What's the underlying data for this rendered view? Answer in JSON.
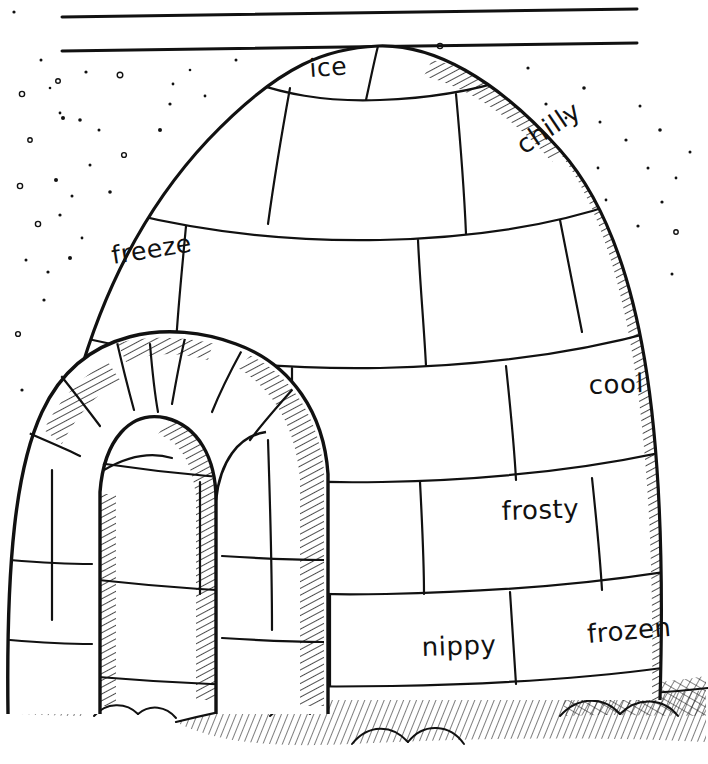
{
  "page": {
    "background_color": "#ffffff",
    "ink_color": "#111111",
    "width": 708,
    "height": 764
  },
  "header_rules": {
    "name": "ruled-lines",
    "count": 2,
    "lines": [
      {
        "x1": 62,
        "y1": 17,
        "x2": 637,
        "y2": 9
      },
      {
        "x1": 62,
        "y1": 51,
        "x2": 637,
        "y2": 43
      }
    ]
  },
  "scene": {
    "subject": "igloo",
    "description": "Hand-drawn line art of an igloo built from snow blocks, with falling snow in the sky and a shadowed snowy ground.",
    "parts": [
      "dome",
      "entrance-tunnel",
      "snowfall",
      "ground-shadow",
      "snow-mounds"
    ]
  },
  "words": [
    {
      "id": "ice",
      "text": "ice",
      "x": 310,
      "y": 77,
      "rotation": -4,
      "size": 25
    },
    {
      "id": "chilly",
      "text": "chilly",
      "x": 524,
      "y": 155,
      "rotation": -34,
      "size": 26
    },
    {
      "id": "freeze",
      "text": "freeze",
      "x": 113,
      "y": 264,
      "rotation": -9,
      "size": 25
    },
    {
      "id": "cool",
      "text": "cool",
      "x": 589,
      "y": 394,
      "rotation": -2,
      "size": 26
    },
    {
      "id": "frosty",
      "text": "frosty",
      "x": 502,
      "y": 520,
      "rotation": -2,
      "size": 26
    },
    {
      "id": "nippy",
      "text": "nippy",
      "x": 422,
      "y": 656,
      "rotation": -2,
      "size": 26
    },
    {
      "id": "frozen",
      "text": "frozen",
      "x": 588,
      "y": 643,
      "rotation": -5,
      "size": 26
    }
  ],
  "snowflakes": [
    {
      "x": 22,
      "y": 94,
      "r": 2.6,
      "ring": true
    },
    {
      "x": 41,
      "y": 60,
      "r": 1.5,
      "ring": false
    },
    {
      "x": 58,
      "y": 81,
      "r": 2.3,
      "ring": true
    },
    {
      "x": 60,
      "y": 113,
      "r": 1.4,
      "ring": false
    },
    {
      "x": 86,
      "y": 72,
      "r": 1.6,
      "ring": false
    },
    {
      "x": 30,
      "y": 140,
      "r": 2.2,
      "ring": true
    },
    {
      "x": 50,
      "y": 88,
      "r": 1.3,
      "ring": false
    },
    {
      "x": 120,
      "y": 75,
      "r": 2.8,
      "ring": true
    },
    {
      "x": 63,
      "y": 118,
      "r": 2.0,
      "ring": false
    },
    {
      "x": 80,
      "y": 120,
      "r": 1.8,
      "ring": false
    },
    {
      "x": 99,
      "y": 130,
      "r": 1.5,
      "ring": false
    },
    {
      "x": 124,
      "y": 155,
      "r": 2.4,
      "ring": true
    },
    {
      "x": 160,
      "y": 130,
      "r": 2.0,
      "ring": false
    },
    {
      "x": 173,
      "y": 84,
      "r": 1.4,
      "ring": false
    },
    {
      "x": 170,
      "y": 104,
      "r": 1.6,
      "ring": false
    },
    {
      "x": 20,
      "y": 186,
      "r": 2.6,
      "ring": true
    },
    {
      "x": 56,
      "y": 180,
      "r": 2.0,
      "ring": false
    },
    {
      "x": 72,
      "y": 196,
      "r": 1.5,
      "ring": false
    },
    {
      "x": 90,
      "y": 165,
      "r": 1.5,
      "ring": false
    },
    {
      "x": 110,
      "y": 192,
      "r": 1.8,
      "ring": false
    },
    {
      "x": 38,
      "y": 224,
      "r": 2.6,
      "ring": true
    },
    {
      "x": 60,
      "y": 215,
      "r": 1.6,
      "ring": false
    },
    {
      "x": 82,
      "y": 238,
      "r": 1.4,
      "ring": false
    },
    {
      "x": 26,
      "y": 260,
      "r": 1.5,
      "ring": false
    },
    {
      "x": 48,
      "y": 272,
      "r": 1.6,
      "ring": false
    },
    {
      "x": 70,
      "y": 258,
      "r": 2.0,
      "ring": false
    },
    {
      "x": 44,
      "y": 300,
      "r": 1.6,
      "ring": false
    },
    {
      "x": 18,
      "y": 334,
      "r": 2.4,
      "ring": true
    },
    {
      "x": 22,
      "y": 390,
      "r": 1.6,
      "ring": false
    },
    {
      "x": 190,
      "y": 70,
      "r": 1.3,
      "ring": false
    },
    {
      "x": 205,
      "y": 96,
      "r": 1.4,
      "ring": false
    },
    {
      "x": 236,
      "y": 60,
      "r": 1.5,
      "ring": false
    },
    {
      "x": 440,
      "y": 46,
      "r": 2.6,
      "ring": true
    },
    {
      "x": 470,
      "y": 98,
      "r": 1.5,
      "ring": false
    },
    {
      "x": 498,
      "y": 110,
      "r": 2.2,
      "ring": true
    },
    {
      "x": 528,
      "y": 68,
      "r": 1.6,
      "ring": false
    },
    {
      "x": 546,
      "y": 104,
      "r": 1.6,
      "ring": false
    },
    {
      "x": 566,
      "y": 118,
      "r": 1.4,
      "ring": false
    },
    {
      "x": 584,
      "y": 88,
      "r": 1.8,
      "ring": false
    },
    {
      "x": 600,
      "y": 122,
      "r": 1.5,
      "ring": false
    },
    {
      "x": 552,
      "y": 152,
      "r": 2.2,
      "ring": true
    },
    {
      "x": 598,
      "y": 168,
      "r": 1.4,
      "ring": false
    },
    {
      "x": 626,
      "y": 140,
      "r": 1.6,
      "ring": false
    },
    {
      "x": 640,
      "y": 106,
      "r": 1.5,
      "ring": false
    },
    {
      "x": 660,
      "y": 130,
      "r": 1.8,
      "ring": false
    },
    {
      "x": 648,
      "y": 168,
      "r": 1.5,
      "ring": false
    },
    {
      "x": 676,
      "y": 178,
      "r": 1.4,
      "ring": false
    },
    {
      "x": 662,
      "y": 202,
      "r": 1.6,
      "ring": false
    },
    {
      "x": 690,
      "y": 152,
      "r": 1.5,
      "ring": false
    },
    {
      "x": 606,
      "y": 200,
      "r": 1.4,
      "ring": false
    },
    {
      "x": 638,
      "y": 226,
      "r": 1.6,
      "ring": false
    },
    {
      "x": 676,
      "y": 232,
      "r": 2.2,
      "ring": true
    },
    {
      "x": 672,
      "y": 274,
      "r": 1.5,
      "ring": false
    },
    {
      "x": 14,
      "y": 12,
      "r": 1.6,
      "ring": false
    },
    {
      "x": 258,
      "y": 118,
      "r": 1.2,
      "ring": false
    }
  ]
}
